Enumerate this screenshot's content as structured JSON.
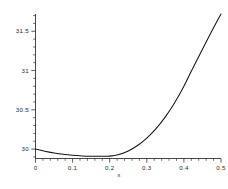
{
  "chart_data": {
    "type": "line",
    "title": "",
    "subtitle": "",
    "xlabel": "x",
    "ylabel": "",
    "xlim": [
      0,
      0.5
    ],
    "ylim": [
      29.88,
      31.72
    ],
    "grid": false,
    "legend": null,
    "xticks": [
      0,
      0.1,
      0.2,
      0.3,
      0.4,
      0.5
    ],
    "xticklabels": [
      "0",
      "0.1",
      "0.2",
      "0.3",
      "0.4",
      "0.5"
    ],
    "yticks": [
      30,
      30.5,
      31,
      31.5
    ],
    "yticklabels": [
      "30",
      "30.5",
      "31",
      "31.5"
    ],
    "x_minor_tick_count": 5,
    "y_minor_tick_count": 5,
    "series": [
      {
        "name": "curve",
        "color": "#151515",
        "x": [
          0.0,
          0.025,
          0.05,
          0.075,
          0.1,
          0.125,
          0.15,
          0.175,
          0.2,
          0.225,
          0.25,
          0.275,
          0.3,
          0.325,
          0.35,
          0.375,
          0.4,
          0.425,
          0.45,
          0.475,
          0.5
        ],
        "y": [
          30.0,
          29.972,
          29.95,
          29.933,
          29.921,
          29.913,
          29.909,
          29.908,
          29.91,
          29.93,
          29.975,
          30.045,
          30.14,
          30.26,
          30.41,
          30.59,
          30.8,
          31.04,
          31.27,
          31.5,
          31.72
        ]
      }
    ],
    "annotations": {
      "minimum_x": 0.19,
      "minimum_y": 29.908,
      "start_point": {
        "x": 0.0,
        "y": 30.0
      },
      "end_point": {
        "x": 0.5,
        "y": 31.72
      }
    }
  },
  "axes": {
    "x_axis_name": "x-axis",
    "y_axis_name": "y-axis"
  }
}
